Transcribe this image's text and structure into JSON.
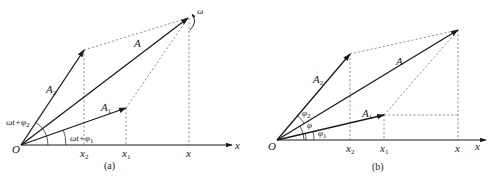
{
  "figure": {
    "panel_a": {
      "caption": "(a)",
      "origin_label": "O",
      "axis_label": "x",
      "vectors": {
        "A": "A",
        "A1": {
          "base": "A",
          "sub": "1"
        },
        "A2": {
          "base": "A",
          "sub": "2"
        }
      },
      "angle_labels": {
        "phase2": {
          "base": "ωt+φ",
          "sub": "2"
        },
        "phase1": {
          "base": "ωt+φ",
          "sub": "1"
        }
      },
      "rotation_label": "ω",
      "projections": {
        "x2": {
          "base": "x",
          "sub": "2"
        },
        "x1": {
          "base": "x",
          "sub": "1"
        },
        "x": "x"
      }
    },
    "panel_b": {
      "caption": "(b)",
      "origin_label": "O",
      "axis_label": "x",
      "vectors": {
        "A": "A",
        "A1": {
          "base": "A",
          "sub": "1"
        },
        "A2": {
          "base": "A",
          "sub": "2"
        }
      },
      "angle_labels": {
        "phi2": {
          "base": "φ",
          "sub": "2"
        },
        "phi": "φ",
        "phi1": {
          "base": "φ",
          "sub": "1"
        }
      },
      "projections": {
        "x2": {
          "base": "x",
          "sub": "2"
        },
        "x1": {
          "base": "x",
          "sub": "1"
        },
        "x": "x"
      }
    }
  }
}
